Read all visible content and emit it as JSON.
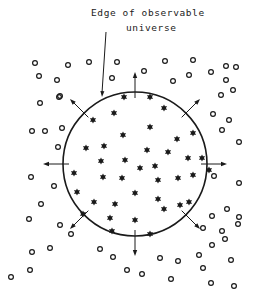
{
  "diagram": {
    "label": {
      "line1": "Edge of observable",
      "line2": "universe"
    },
    "colors": {
      "ink": "#1a1a1a",
      "background": "#ffffff"
    },
    "circle": {
      "cx": 135,
      "cy": 164,
      "r": 72
    },
    "pointer": {
      "x1": 106,
      "y1": 32,
      "x2": 102,
      "y2": 97
    },
    "arrows": [
      {
        "angle": -90
      },
      {
        "angle": -45
      },
      {
        "angle": 0
      },
      {
        "angle": 45
      },
      {
        "angle": 90
      },
      {
        "angle": 135
      },
      {
        "angle": 180
      },
      {
        "angle": -135
      }
    ],
    "stars": [
      [
        124,
        97
      ],
      [
        150,
        97
      ],
      [
        114,
        113
      ],
      [
        164,
        108
      ],
      [
        93,
        120
      ],
      [
        150,
        127
      ],
      [
        123,
        135
      ],
      [
        177,
        139
      ],
      [
        193,
        133
      ],
      [
        104,
        146
      ],
      [
        86,
        148
      ],
      [
        147,
        150
      ],
      [
        168,
        152
      ],
      [
        188,
        158
      ],
      [
        202,
        158
      ],
      [
        101,
        161
      ],
      [
        125,
        160
      ],
      [
        140,
        168
      ],
      [
        155,
        166
      ],
      [
        74,
        173
      ],
      [
        103,
        177
      ],
      [
        122,
        178
      ],
      [
        158,
        180
      ],
      [
        178,
        178
      ],
      [
        193,
        175
      ],
      [
        209,
        170
      ],
      [
        77,
        192
      ],
      [
        94,
        202
      ],
      [
        115,
        204
      ],
      [
        135,
        193
      ],
      [
        158,
        199
      ],
      [
        180,
        205
      ],
      [
        83,
        214
      ],
      [
        110,
        218
      ],
      [
        135,
        220
      ],
      [
        164,
        209
      ],
      [
        189,
        202
      ],
      [
        112,
        231
      ],
      [
        150,
        234
      ]
    ],
    "galaxies": [
      [
        35,
        63
      ],
      [
        68,
        65
      ],
      [
        89,
        62
      ],
      [
        117,
        62
      ],
      [
        165,
        61
      ],
      [
        193,
        60
      ],
      [
        226,
        66
      ],
      [
        236,
        67
      ],
      [
        39,
        76
      ],
      [
        57,
        80
      ],
      [
        112,
        78
      ],
      [
        144,
        71
      ],
      [
        173,
        81
      ],
      [
        189,
        75
      ],
      [
        211,
        72
      ],
      [
        226,
        80
      ],
      [
        59,
        97
      ],
      [
        221,
        95
      ],
      [
        233,
        90
      ],
      [
        40,
        103
      ],
      [
        60,
        96
      ],
      [
        32,
        131
      ],
      [
        45,
        131
      ],
      [
        62,
        128
      ],
      [
        58,
        147
      ],
      [
        213,
        114
      ],
      [
        222,
        130
      ],
      [
        229,
        120
      ],
      [
        239,
        142
      ],
      [
        31,
        177
      ],
      [
        54,
        186
      ],
      [
        41,
        204
      ],
      [
        29,
        219
      ],
      [
        60,
        225
      ],
      [
        214,
        176
      ],
      [
        239,
        183
      ],
      [
        227,
        209
      ],
      [
        239,
        217
      ],
      [
        71,
        234
      ],
      [
        203,
        228
      ],
      [
        212,
        216
      ],
      [
        222,
        231
      ],
      [
        238,
        224
      ],
      [
        11,
        277
      ],
      [
        30,
        270
      ],
      [
        32,
        252
      ],
      [
        50,
        248
      ],
      [
        100,
        249
      ],
      [
        113,
        257
      ],
      [
        127,
        270
      ],
      [
        142,
        274
      ],
      [
        160,
        258
      ],
      [
        178,
        261
      ],
      [
        199,
        255
      ],
      [
        203,
        268
      ],
      [
        212,
        245
      ],
      [
        225,
        239
      ],
      [
        231,
        260
      ],
      [
        211,
        283
      ],
      [
        234,
        286
      ],
      [
        171,
        279
      ]
    ]
  }
}
